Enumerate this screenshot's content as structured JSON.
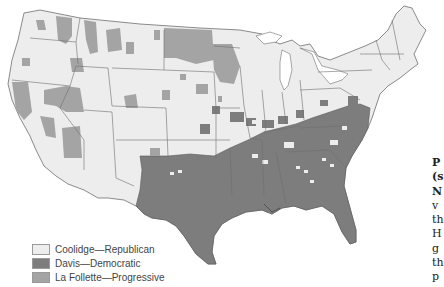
{
  "map": {
    "title": "1924 Presidential Election by County",
    "colors": {
      "republican": "#ededed",
      "democratic": "#7a7a7a",
      "progressive": "#a4a4a4",
      "border": "#6e6e6e",
      "water": "#ffffff"
    }
  },
  "legend": {
    "items": [
      {
        "label": "Coolidge—Republican",
        "color": "#ededed"
      },
      {
        "label": "Davis—Democratic",
        "color": "#7d7d7d"
      },
      {
        "label": "La Follette—Progressive",
        "color": "#a4a4a4"
      }
    ]
  },
  "side_text": {
    "lines": [
      "P",
      "(s",
      "N",
      "v",
      "th",
      "H",
      "g",
      "th",
      "p"
    ]
  }
}
